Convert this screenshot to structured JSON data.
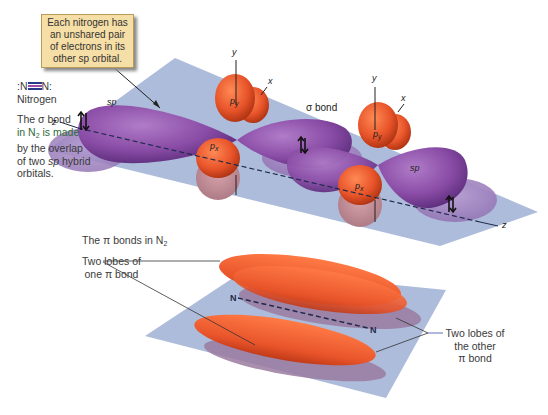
{
  "callout": {
    "lines": [
      "Each nitrogen has",
      "an unshared pair",
      "of electrons in its",
      "other sp orbital."
    ]
  },
  "formula": {
    "left": ":N",
    "right": "N:",
    "name": "Nitrogen",
    "bond_colors": [
      "#2a3a8a",
      "#a04aa8",
      "#2a3a8a"
    ]
  },
  "sigma_caption": {
    "line1": "The σ bond",
    "line2_prefix": "in N",
    "line2_sub": "2",
    "line2_suffix": " is made",
    "line3": "by the overlap",
    "line4_prefix": "of two ",
    "line4_italic": "sp",
    "line4_suffix": " hybrid",
    "line5": "orbitals."
  },
  "top_diagram": {
    "axis_labels": {
      "z_left": "z",
      "z_right": "z",
      "y_left": "y",
      "y_right": "y",
      "x_left": "x",
      "x_right": "x"
    },
    "orbital_labels": {
      "sp_left": "sp",
      "sp_right": "sp",
      "py_left": "p",
      "py_left_sub": "y",
      "px_left": "p",
      "px_left_sub": "x",
      "py_right": "p",
      "py_right_sub": "y",
      "px_right": "p",
      "px_right_sub": "x",
      "sigma_bond": "σ bond"
    },
    "colors": {
      "plane": "#a9b8d8",
      "sp_orbital": "#8a4ca6",
      "p_orbital": "#e8542a"
    }
  },
  "pi_section": {
    "title_prefix": "The π bonds in N",
    "title_sub": "2",
    "left_label": [
      "Two lobes of",
      "one π bond"
    ],
    "right_label": [
      "Two lobes of",
      "the other",
      "π bond"
    ],
    "atom_left": "N",
    "atom_right": "N"
  }
}
